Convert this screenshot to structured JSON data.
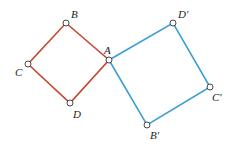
{
  "diagram": {
    "red_color": "#c8452f",
    "blue_color": "#3a9fd4",
    "red_square": {
      "points": {
        "B": [
          66,
          23
        ],
        "A": [
          109,
          60
        ],
        "D": [
          70,
          103
        ],
        "C": [
          28,
          64
        ]
      }
    },
    "blue_square": {
      "points": {
        "A": [
          109,
          60
        ],
        "D'": [
          173,
          23
        ],
        "C'": [
          210,
          87
        ],
        "B'": [
          147,
          125
        ]
      }
    },
    "labels": {
      "A": "A",
      "B": "B",
      "C": "C",
      "D": "D",
      "Dp": "D′",
      "Cp": "C′",
      "Bp": "B′"
    }
  }
}
